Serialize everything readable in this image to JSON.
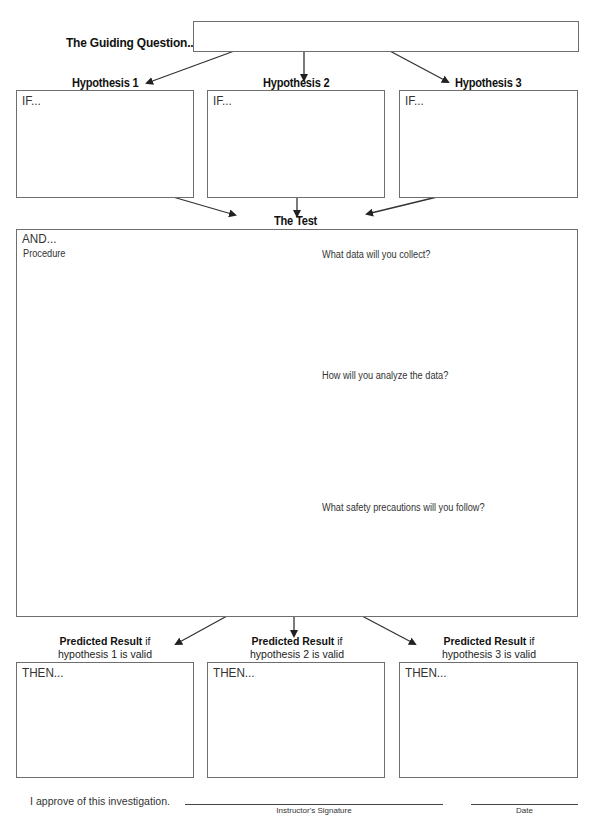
{
  "guiding_question": {
    "label": "The Guiding Question...",
    "value": ""
  },
  "hypotheses": [
    {
      "title": "Hypothesis 1",
      "lead": "IF...",
      "value": ""
    },
    {
      "title": "Hypothesis 2",
      "lead": "IF...",
      "value": ""
    },
    {
      "title": "Hypothesis 3",
      "lead": "IF...",
      "value": ""
    }
  ],
  "test": {
    "title": "The Test",
    "lead": "AND...",
    "procedure_label": "Procedure",
    "questions": [
      "What data will you collect?",
      "How will you analyze the data?",
      "What safety precautions will you follow?"
    ]
  },
  "predicted_results": [
    {
      "bold": "Predicted Result",
      "suffix": " if",
      "line2": "hypothesis 1 is valid",
      "lead": "THEN...",
      "value": ""
    },
    {
      "bold": "Predicted Result",
      "suffix": " if",
      "line2": "hypothesis 2 is valid",
      "lead": "THEN...",
      "value": ""
    },
    {
      "bold": "Predicted Result",
      "suffix": " if",
      "line2": "hypothesis 3 is valid",
      "lead": "THEN...",
      "value": ""
    }
  ],
  "approval": {
    "statement": "I approve of this investigation.",
    "signature_caption": "Instructor's Signature",
    "date_caption": "Date"
  }
}
